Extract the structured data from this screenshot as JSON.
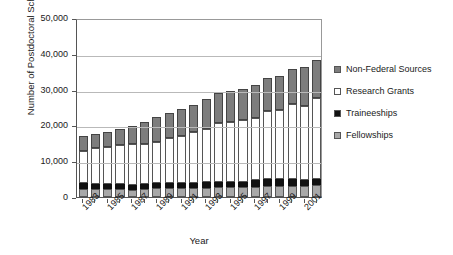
{
  "chart_data": {
    "type": "bar",
    "subtype": "stacked-bar",
    "title": "",
    "xlabel": "Year",
    "ylabel": "Number of Postdoctoral Scholars",
    "ylim": [
      0,
      50000
    ],
    "ytick_labels": [
      "50,000",
      "40,000",
      "30,000",
      "20,000",
      "10,000",
      "0"
    ],
    "ytick_values": [
      50000,
      40000,
      30000,
      20000,
      10000,
      0
    ],
    "grid": true,
    "legend_position": "right",
    "categories": [
      "1983",
      "1984",
      "1985",
      "1986",
      "1987",
      "1988",
      "1989",
      "1990",
      "1991",
      "1992",
      "1993",
      "1994",
      "1995",
      "1996",
      "1997",
      "1998",
      "1999",
      "2000",
      "2001",
      "2002"
    ],
    "xtick_labels_shown": [
      "1983",
      "1985",
      "1987",
      "1989",
      "1991",
      "1993",
      "1995",
      "1997",
      "1999",
      "2001"
    ],
    "series": [
      {
        "name": "Fellowships",
        "color": "#a8a8a8",
        "values": [
          2200,
          2300,
          2300,
          2200,
          2000,
          2300,
          2400,
          2400,
          2400,
          2500,
          2600,
          2700,
          2700,
          2700,
          2800,
          3000,
          3100,
          3100,
          3000,
          3400
        ]
      },
      {
        "name": "Traineeships",
        "color": "#111111",
        "values": [
          1600,
          1400,
          1300,
          1400,
          1400,
          1400,
          1400,
          1400,
          1400,
          1500,
          1500,
          1500,
          1500,
          1600,
          1900,
          1900,
          1800,
          1900,
          1700,
          1700
        ]
      },
      {
        "name": "Research Grants",
        "color": "#ffffff",
        "values": [
          9000,
          10100,
          10500,
          10800,
          11400,
          11000,
          11500,
          12600,
          13200,
          14100,
          14900,
          16400,
          16800,
          17200,
          17500,
          19000,
          19400,
          21000,
          20800,
          22500
        ]
      },
      {
        "name": "Non-Federal Sources",
        "color": "#7d7d7d",
        "values": [
          4200,
          3700,
          4100,
          4700,
          5000,
          6300,
          7100,
          7000,
          7600,
          7700,
          8300,
          8500,
          8600,
          8800,
          9200,
          9400,
          9500,
          9900,
          10700,
          10700
        ]
      }
    ],
    "totals": [
      17000,
      17500,
      18200,
      19100,
      19800,
      21000,
      22400,
      23400,
      24600,
      25800,
      27300,
      29100,
      29600,
      30300,
      31400,
      33300,
      33800,
      35900,
      36200,
      38300
    ]
  },
  "legend": {
    "entries": [
      {
        "label": "Non-Federal Sources",
        "swatch": "#7d7d7d"
      },
      {
        "label": "Research Grants",
        "swatch": "#ffffff"
      },
      {
        "label": "Traineeships",
        "swatch": "#111111"
      },
      {
        "label": "Fellowships",
        "swatch": "#a8a8a8"
      }
    ]
  }
}
